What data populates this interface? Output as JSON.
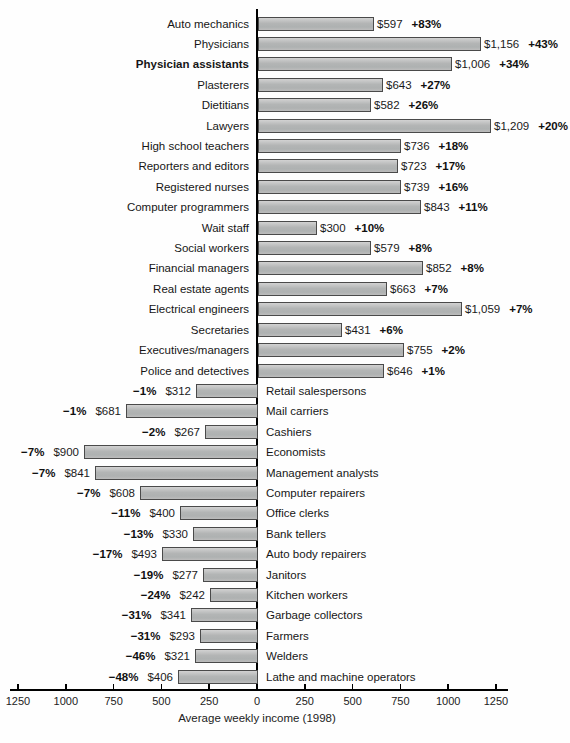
{
  "chart_data": {
    "type": "bar",
    "orientation": "horizontal-diverging",
    "title": "",
    "xlabel": "Average weekly income (1998)",
    "ylabel": "",
    "grid": false,
    "legend": "none",
    "axis_max_each_side": 1250,
    "axis_tick_values": [
      -1250,
      -1000,
      -750,
      -500,
      -250,
      0,
      250,
      500,
      750,
      1000,
      1250
    ],
    "axis_tick_labels": [
      "1250",
      "1000",
      "750",
      "500",
      "250",
      "0",
      "250",
      "500",
      "750",
      "1000",
      "1250"
    ],
    "bar_color": "#b3b5b5",
    "bar_border_color": "#4a4a4a",
    "axis_color": "#000000",
    "rows": [
      {
        "label": "Auto mechanics",
        "income": 597,
        "income_label": "$597",
        "change_pct": 83,
        "change_label": "+83%",
        "emphasized": false
      },
      {
        "label": "Physicians",
        "income": 1156,
        "income_label": "$1,156",
        "change_pct": 43,
        "change_label": "+43%",
        "emphasized": false
      },
      {
        "label": "Physician assistants",
        "income": 1006,
        "income_label": "$1,006",
        "change_pct": 34,
        "change_label": "+34%",
        "emphasized": true
      },
      {
        "label": "Plasterers",
        "income": 643,
        "income_label": "$643",
        "change_pct": 27,
        "change_label": "+27%",
        "emphasized": false
      },
      {
        "label": "Dietitians",
        "income": 582,
        "income_label": "$582",
        "change_pct": 26,
        "change_label": "+26%",
        "emphasized": false
      },
      {
        "label": "Lawyers",
        "income": 1209,
        "income_label": "$1,209",
        "change_pct": 20,
        "change_label": "+20%",
        "emphasized": false
      },
      {
        "label": "High school teachers",
        "income": 736,
        "income_label": "$736",
        "change_pct": 18,
        "change_label": "+18%",
        "emphasized": false
      },
      {
        "label": "Reporters and editors",
        "income": 723,
        "income_label": "$723",
        "change_pct": 17,
        "change_label": "+17%",
        "emphasized": false
      },
      {
        "label": "Registered nurses",
        "income": 739,
        "income_label": "$739",
        "change_pct": 16,
        "change_label": "+16%",
        "emphasized": false
      },
      {
        "label": "Computer programmers",
        "income": 843,
        "income_label": "$843",
        "change_pct": 11,
        "change_label": "+11%",
        "emphasized": false
      },
      {
        "label": "Wait staff",
        "income": 300,
        "income_label": "$300",
        "change_pct": 10,
        "change_label": "+10%",
        "emphasized": false
      },
      {
        "label": "Social workers",
        "income": 579,
        "income_label": "$579",
        "change_pct": 8,
        "change_label": "+8%",
        "emphasized": false
      },
      {
        "label": "Financial managers",
        "income": 852,
        "income_label": "$852",
        "change_pct": 8,
        "change_label": "+8%",
        "emphasized": false
      },
      {
        "label": "Real estate agents",
        "income": 663,
        "income_label": "$663",
        "change_pct": 7,
        "change_label": "+7%",
        "emphasized": false
      },
      {
        "label": "Electrical engineers",
        "income": 1059,
        "income_label": "$1,059",
        "change_pct": 7,
        "change_label": "+7%",
        "emphasized": false
      },
      {
        "label": "Secretaries",
        "income": 431,
        "income_label": "$431",
        "change_pct": 6,
        "change_label": "+6%",
        "emphasized": false
      },
      {
        "label": "Executives/managers",
        "income": 755,
        "income_label": "$755",
        "change_pct": 2,
        "change_label": "+2%",
        "emphasized": false
      },
      {
        "label": "Police and detectives",
        "income": 646,
        "income_label": "$646",
        "change_pct": 1,
        "change_label": "+1%",
        "emphasized": false
      },
      {
        "label": "Retail salespersons",
        "income": 312,
        "income_label": "$312",
        "change_pct": -1,
        "change_label": "−1%",
        "emphasized": false
      },
      {
        "label": "Mail carriers",
        "income": 681,
        "income_label": "$681",
        "change_pct": -1,
        "change_label": "−1%",
        "emphasized": false
      },
      {
        "label": "Cashiers",
        "income": 267,
        "income_label": "$267",
        "change_pct": -2,
        "change_label": "−2%",
        "emphasized": false
      },
      {
        "label": "Economists",
        "income": 900,
        "income_label": "$900",
        "change_pct": -7,
        "change_label": "−7%",
        "emphasized": false
      },
      {
        "label": "Management analysts",
        "income": 841,
        "income_label": "$841",
        "change_pct": -7,
        "change_label": "−7%",
        "emphasized": false
      },
      {
        "label": "Computer repairers",
        "income": 608,
        "income_label": "$608",
        "change_pct": -7,
        "change_label": "−7%",
        "emphasized": false
      },
      {
        "label": "Office clerks",
        "income": 400,
        "income_label": "$400",
        "change_pct": -11,
        "change_label": "−11%",
        "emphasized": false
      },
      {
        "label": "Bank tellers",
        "income": 330,
        "income_label": "$330",
        "change_pct": -13,
        "change_label": "−13%",
        "emphasized": false
      },
      {
        "label": "Auto body repairers",
        "income": 493,
        "income_label": "$493",
        "change_pct": -17,
        "change_label": "−17%",
        "emphasized": false
      },
      {
        "label": "Janitors",
        "income": 277,
        "income_label": "$277",
        "change_pct": -19,
        "change_label": "−19%",
        "emphasized": false
      },
      {
        "label": "Kitchen workers",
        "income": 242,
        "income_label": "$242",
        "change_pct": -24,
        "change_label": "−24%",
        "emphasized": false
      },
      {
        "label": "Garbage collectors",
        "income": 341,
        "income_label": "$341",
        "change_pct": -31,
        "change_label": "−31%",
        "emphasized": false
      },
      {
        "label": "Farmers",
        "income": 293,
        "income_label": "$293",
        "change_pct": -31,
        "change_label": "−31%",
        "emphasized": false
      },
      {
        "label": "Welders",
        "income": 321,
        "income_label": "$321",
        "change_pct": -46,
        "change_label": "−46%",
        "emphasized": false
      },
      {
        "label": "Lathe and machine operators",
        "income": 406,
        "income_label": "$406",
        "change_pct": -48,
        "change_label": "−48%",
        "emphasized": false
      }
    ]
  }
}
